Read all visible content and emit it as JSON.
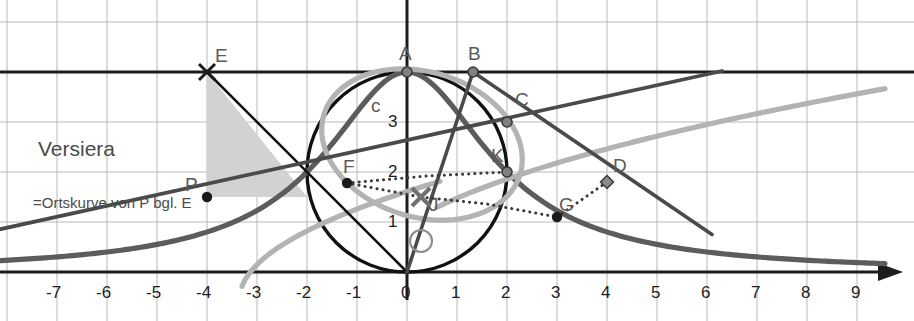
{
  "figure": {
    "title_label": "Versiera",
    "subtitle_label": "=Ortskurve von P bgl. E",
    "curve_label": "c"
  },
  "axes": {
    "x_ticks": [
      "-7",
      "-6",
      "-5",
      "-4",
      "-3",
      "-2",
      "-1",
      "0",
      "1",
      "2",
      "3",
      "4",
      "5",
      "6",
      "7",
      "8",
      "9"
    ],
    "y_ticks": [
      "1",
      "2",
      "3"
    ],
    "origin_label": "O",
    "x_axis_name": "x-axis",
    "y_axis_name": "y-axis",
    "unit_px": 50,
    "origin_px": [
      407,
      272
    ],
    "grid": true
  },
  "points": [
    {
      "id": "E",
      "label": "E",
      "x": -4,
      "y": 4,
      "marker": "cross",
      "label_dx": 8,
      "label_dy": -26
    },
    {
      "id": "P",
      "label": "P",
      "x": -4,
      "y": 1.5,
      "marker": "dot",
      "label_dx": -22,
      "label_dy": -22
    },
    {
      "id": "A",
      "label": "A",
      "x": 0,
      "y": 4,
      "marker": "circle",
      "label_dx": -8,
      "label_dy": -28
    },
    {
      "id": "B",
      "label": "B",
      "x": 1.32,
      "y": 4,
      "marker": "circle",
      "label_dx": -5,
      "label_dy": -28
    },
    {
      "id": "C",
      "label": "C",
      "x": 2,
      "y": 3,
      "marker": "circle",
      "label_dx": 8,
      "label_dy": -32
    },
    {
      "id": "D",
      "label": "D",
      "x": 4,
      "y": 1.8,
      "marker": "diamond",
      "label_dx": 6,
      "label_dy": -26
    },
    {
      "id": "F",
      "label": "F",
      "x": -1.2,
      "y": 1.78,
      "marker": "dot",
      "label_dx": -4,
      "label_dy": -26
    },
    {
      "id": "K",
      "label": "K",
      "x": 2,
      "y": 2,
      "marker": "circle",
      "label_dx": -16,
      "label_dy": -26
    },
    {
      "id": "J",
      "label": "J",
      "x": 0.28,
      "y": 1.5,
      "marker": "xmark",
      "label_dx": 8,
      "label_dy": -2
    },
    {
      "id": "G",
      "label": "G",
      "x": 3,
      "y": 1.1,
      "marker": "dot",
      "label_dx": 2,
      "label_dy": -22
    }
  ],
  "colors": {
    "axis": "#1c1c1c",
    "grid": "#b9b9b9",
    "circle": "#111111",
    "versiera": "#5c5c5c",
    "locus_light": "#b3b3b3",
    "chord": "#4a4a4a",
    "triangle_fill": "#d2d2d2",
    "label": "#5a5a5a",
    "dotted": "#3a3a3a"
  },
  "curves": {
    "versiera_name": "versiera-curve",
    "locus_name": "locus-curve",
    "circle_name": "generating-circle",
    "circle_center": [
      0,
      2
    ],
    "circle_radius": 2
  }
}
